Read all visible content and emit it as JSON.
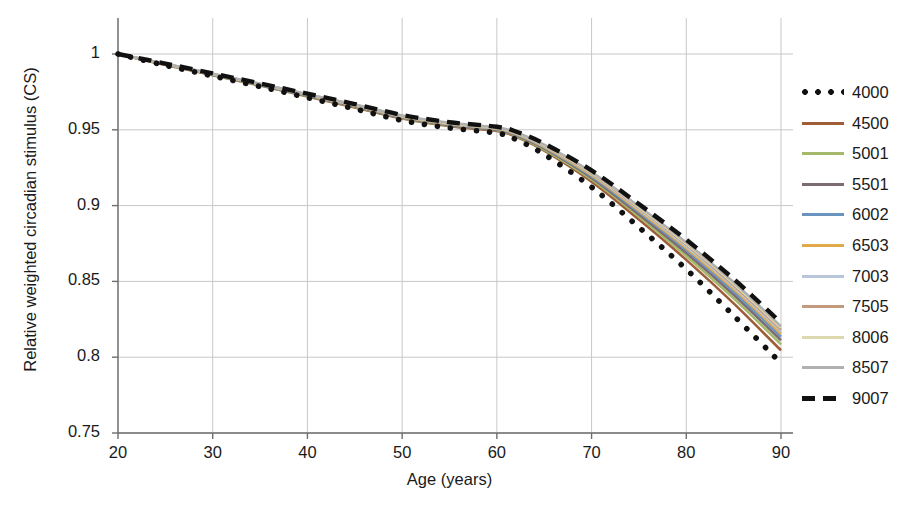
{
  "chart_data": {
    "type": "line",
    "title": "",
    "xlabel": "Age (years)",
    "ylabel": "Relative weighted circadian stimulus (CS)",
    "xlim": [
      20,
      90
    ],
    "ylim": [
      0.75,
      1.0
    ],
    "xticks": [
      "20",
      "30",
      "40",
      "50",
      "60",
      "70",
      "80",
      "90"
    ],
    "xtick_values": [
      20,
      30,
      40,
      50,
      60,
      70,
      80,
      90
    ],
    "yticks": [
      "1",
      "0.95",
      "0.9",
      "0.85",
      "0.8",
      "0.75"
    ],
    "ytick_values": [
      1,
      0.95,
      0.9,
      0.85,
      0.8,
      0.75
    ],
    "grid": true,
    "legend_position": "right",
    "x": [
      20,
      25,
      30,
      35,
      40,
      45,
      50,
      55,
      60,
      62,
      65,
      70,
      75,
      80,
      85,
      90
    ],
    "series": [
      {
        "name": "4000",
        "color": "#111111",
        "style": "dotted",
        "values": [
          1.0,
          0.9925,
          0.9855,
          0.9785,
          0.9712,
          0.9638,
          0.9562,
          0.9512,
          0.9478,
          0.9437,
          0.9338,
          0.9122,
          0.8857,
          0.858,
          0.8275,
          0.796
        ]
      },
      {
        "name": "4500",
        "color": "#9e5c37",
        "style": "solid",
        "values": [
          1.0,
          0.9928,
          0.986,
          0.9792,
          0.972,
          0.9648,
          0.9574,
          0.9524,
          0.9492,
          0.9455,
          0.9362,
          0.9158,
          0.8908,
          0.8642,
          0.8355,
          0.8045
        ]
      },
      {
        "name": "5001",
        "color": "#a5b96a",
        "style": "solid",
        "values": [
          1.0,
          0.993,
          0.9862,
          0.9794,
          0.9723,
          0.9652,
          0.9578,
          0.9528,
          0.9497,
          0.9461,
          0.937,
          0.9172,
          0.8927,
          0.8668,
          0.8388,
          0.8085
        ]
      },
      {
        "name": "5501",
        "color": "#7d6b72",
        "style": "solid",
        "values": [
          1.0,
          0.9931,
          0.9863,
          0.9796,
          0.9725,
          0.9655,
          0.9581,
          0.9531,
          0.95,
          0.9466,
          0.9377,
          0.9183,
          0.8942,
          0.8688,
          0.8412,
          0.8112
        ]
      },
      {
        "name": "6002",
        "color": "#6b93bf",
        "style": "solid",
        "values": [
          1.0,
          0.9932,
          0.9865,
          0.9798,
          0.9728,
          0.9658,
          0.9584,
          0.9535,
          0.9504,
          0.947,
          0.9383,
          0.9193,
          0.8956,
          0.8705,
          0.8432,
          0.8135
        ]
      },
      {
        "name": "6503",
        "color": "#e0a94a",
        "style": "solid",
        "values": [
          1.0,
          0.9933,
          0.9866,
          0.98,
          0.973,
          0.966,
          0.9587,
          0.9538,
          0.9507,
          0.9474,
          0.9388,
          0.92,
          0.8966,
          0.8719,
          0.8449,
          0.8155
        ]
      },
      {
        "name": "7003",
        "color": "#b9c6da",
        "style": "solid",
        "values": [
          1.0,
          0.9934,
          0.9867,
          0.9801,
          0.9732,
          0.9662,
          0.9589,
          0.954,
          0.951,
          0.9477,
          0.9392,
          0.9207,
          0.8976,
          0.8731,
          0.8463,
          0.817
        ]
      },
      {
        "name": "7505",
        "color": "#c49a7c",
        "style": "solid",
        "values": [
          1.0,
          0.9935,
          0.9868,
          0.9802,
          0.9733,
          0.9664,
          0.9591,
          0.9542,
          0.9512,
          0.948,
          0.9396,
          0.9212,
          0.8984,
          0.8741,
          0.8475,
          0.8183
        ]
      },
      {
        "name": "8006",
        "color": "#ddd9ae",
        "style": "solid",
        "values": [
          1.0,
          0.9935,
          0.9869,
          0.9803,
          0.9734,
          0.9666,
          0.9593,
          0.9544,
          0.9514,
          0.9482,
          0.9399,
          0.9217,
          0.899,
          0.8749,
          0.8485,
          0.8194
        ]
      },
      {
        "name": "8507",
        "color": "#b0b0b0",
        "style": "solid",
        "values": [
          1.0,
          0.9936,
          0.987,
          0.9804,
          0.9735,
          0.9667,
          0.9594,
          0.9546,
          0.9516,
          0.9484,
          0.9402,
          0.9221,
          0.8996,
          0.8757,
          0.8494,
          0.8204
        ]
      },
      {
        "name": "9007",
        "color": "#111111",
        "style": "dashed",
        "values": [
          1.0,
          0.9937,
          0.9872,
          0.9806,
          0.9738,
          0.967,
          0.9598,
          0.955,
          0.952,
          0.9489,
          0.9409,
          0.9232,
          0.901,
          0.8775,
          0.8516,
          0.8228
        ]
      }
    ]
  },
  "axes": {
    "ylabel": "Relative weighted circadian stimulus (CS)",
    "xlabel": "Age (years)",
    "ytick_labels": [
      "1",
      "0.95",
      "0.9",
      "0.85",
      "0.8",
      "0.75"
    ],
    "xtick_labels": [
      "20",
      "30",
      "40",
      "50",
      "60",
      "70",
      "80",
      "90"
    ]
  },
  "legend": {
    "entries": [
      {
        "label": "4000",
        "color": "#111111",
        "style": "dotted"
      },
      {
        "label": "4500",
        "color": "#9e5c37",
        "style": "solid"
      },
      {
        "label": "5001",
        "color": "#a5b96a",
        "style": "solid"
      },
      {
        "label": "5501",
        "color": "#7d6b72",
        "style": "solid"
      },
      {
        "label": "6002",
        "color": "#6b93bf",
        "style": "solid"
      },
      {
        "label": "6503",
        "color": "#e0a94a",
        "style": "solid"
      },
      {
        "label": "7003",
        "color": "#b9c6da",
        "style": "solid"
      },
      {
        "label": "7505",
        "color": "#c49a7c",
        "style": "solid"
      },
      {
        "label": "8006",
        "color": "#ddd9ae",
        "style": "solid"
      },
      {
        "label": "8507",
        "color": "#b0b0b0",
        "style": "solid"
      },
      {
        "label": "9007",
        "color": "#111111",
        "style": "dashed"
      }
    ]
  },
  "style": {
    "axis_color": "#6e6e6e",
    "grid_color": "#c8c8c8",
    "text_color": "#1a1a1a",
    "background": "#ffffff"
  }
}
